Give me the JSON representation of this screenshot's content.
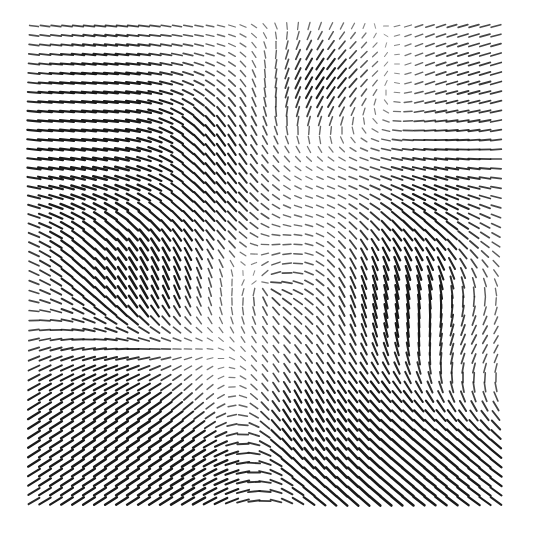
{
  "figure": {
    "type": "vector-field-quiver",
    "background": "#ffffff",
    "arrow_color": "#1a1a1a",
    "grid": {
      "x0": 34,
      "y0": 26,
      "dx": 11,
      "dy": 9.5,
      "cols": 43,
      "rows": 51
    },
    "base_length": 4,
    "max_length": 14
  },
  "chart_data": {
    "type": "quiver",
    "title": "",
    "xlabel": "",
    "ylabel": "",
    "grid_on": false,
    "legend": "none",
    "regions": [
      {
        "name": "top-left",
        "bbox": [
          34,
          26,
          200,
          130
        ],
        "direction_deg": 0,
        "magnitude": "low-to-medium",
        "note": "horizontal rightward flow, strengthening downward"
      },
      {
        "name": "upper-left-band",
        "bbox": [
          34,
          100,
          230,
          190
        ],
        "direction_deg": 0,
        "magnitude": "high",
        "note": "strong horizontal flow bending downward at right"
      },
      {
        "name": "top-right",
        "bbox": [
          400,
          26,
          505,
          130
        ],
        "direction_deg": 20,
        "magnitude": "medium",
        "note": "diagonal flow up-right"
      },
      {
        "name": "top-center-blob",
        "bbox": [
          290,
          50,
          350,
          110
        ],
        "direction_deg": 120,
        "magnitude": "high",
        "note": "dark converging region"
      },
      {
        "name": "center-singularity",
        "center": [
          265,
          285
        ],
        "type": "radial",
        "magnitude": "zero at center"
      },
      {
        "name": "left-mid",
        "bbox": [
          60,
          210,
          190,
          330
        ],
        "direction_deg": 110,
        "magnitude": "high",
        "note": "near-vertical strong flow"
      },
      {
        "name": "right-mid",
        "bbox": [
          370,
          250,
          450,
          330
        ],
        "direction_deg": 95,
        "magnitude": "high",
        "note": "near-vertical strong flow"
      },
      {
        "name": "right-lower-band",
        "bbox": [
          420,
          320,
          505,
          380
        ],
        "direction_deg": 180,
        "magnitude": "high",
        "note": "horizontal flow"
      },
      {
        "name": "bottom-left",
        "bbox": [
          34,
          330,
          200,
          509
        ],
        "direction_deg": -40,
        "magnitude": "high",
        "note": "diagonal flow up-right"
      },
      {
        "name": "bottom-right",
        "bbox": [
          380,
          400,
          505,
          509
        ],
        "direction_deg": 40,
        "magnitude": "high",
        "note": "diagonal flow down-right"
      }
    ],
    "sources": [
      {
        "type": "uniform",
        "angle": 12,
        "weight": 0.25
      },
      {
        "type": "radial",
        "x": 265,
        "y": 285,
        "sign": 1,
        "strength": 0.6,
        "radius": 45
      },
      {
        "type": "blob",
        "x": 90,
        "y": 150,
        "angle": 2,
        "strength": 1.3,
        "radius": 75
      },
      {
        "type": "blob",
        "x": 120,
        "y": 60,
        "angle": 8,
        "strength": 0.5,
        "radius": 70
      },
      {
        "type": "blob",
        "x": 455,
        "y": 80,
        "angle": -25,
        "strength": 0.9,
        "radius": 80
      },
      {
        "type": "blob",
        "x": 320,
        "y": 80,
        "angle": 125,
        "strength": 1.4,
        "radius": 40
      },
      {
        "type": "blob",
        "x": 370,
        "y": 70,
        "angle": 175,
        "strength": 0.8,
        "radius": 45
      },
      {
        "type": "blob",
        "x": 215,
        "y": 140,
        "angle": 80,
        "strength": 1.0,
        "radius": 40
      },
      {
        "type": "blob",
        "x": 110,
        "y": 265,
        "angle": 70,
        "strength": 1.3,
        "radius": 55
      },
      {
        "type": "blob",
        "x": 160,
        "y": 280,
        "angle": 95,
        "strength": 1.0,
        "radius": 40
      },
      {
        "type": "blob",
        "x": 230,
        "y": 215,
        "angle": 60,
        "strength": 0.8,
        "radius": 35
      },
      {
        "type": "blob",
        "x": 400,
        "y": 290,
        "angle": 95,
        "strength": 1.4,
        "radius": 50
      },
      {
        "type": "blob",
        "x": 430,
        "y": 210,
        "angle": 30,
        "strength": 0.9,
        "radius": 55
      },
      {
        "type": "blob",
        "x": 470,
        "y": 355,
        "angle": 180,
        "strength": 1.2,
        "radius": 50
      },
      {
        "type": "blob",
        "x": 300,
        "y": 420,
        "angle": 90,
        "strength": 1.1,
        "radius": 45
      },
      {
        "type": "blob",
        "x": 210,
        "y": 390,
        "angle": 180,
        "strength": 0.6,
        "radius": 40
      },
      {
        "type": "blob",
        "x": 90,
        "y": 440,
        "angle": -40,
        "strength": 1.6,
        "radius": 90
      },
      {
        "type": "blob",
        "x": 200,
        "y": 470,
        "angle": -35,
        "strength": 1.0,
        "radius": 60
      },
      {
        "type": "blob",
        "x": 440,
        "y": 450,
        "angle": 40,
        "strength": 1.6,
        "radius": 85
      },
      {
        "type": "blob",
        "x": 350,
        "y": 480,
        "angle": 50,
        "strength": 0.8,
        "radius": 50
      }
    ]
  }
}
